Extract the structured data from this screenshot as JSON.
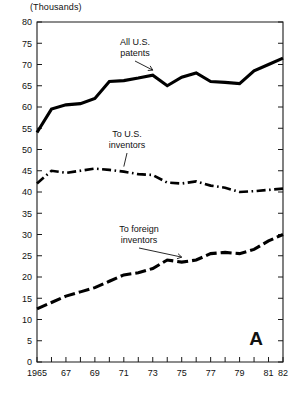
{
  "chart_data": {
    "type": "line",
    "title": "",
    "subtitle": "",
    "panel_label": "A",
    "unit_note": "(Thousands)",
    "xlabel": "",
    "ylabel": "",
    "xlim": [
      1965,
      1982
    ],
    "ylim": [
      0,
      80
    ],
    "ytick_step": 5,
    "grid": false,
    "legend_position": "inline-annotations",
    "x": [
      1965,
      1966,
      1967,
      1968,
      1969,
      1970,
      1971,
      1972,
      1973,
      1974,
      1975,
      1976,
      1977,
      1978,
      1979,
      1980,
      1981,
      1982
    ],
    "xtick_labels": [
      "1965",
      "",
      "67",
      "",
      "69",
      "",
      "71",
      "",
      "73",
      "",
      "75",
      "",
      "77",
      "",
      "79",
      "",
      "81",
      "82"
    ],
    "ytick_labels": [
      "0",
      "5",
      "10",
      "15",
      "20",
      "25",
      "30",
      "35",
      "40",
      "45",
      "50",
      "55",
      "60",
      "65",
      "70",
      "75",
      "80"
    ],
    "series": [
      {
        "name": "All U.S. patents",
        "style": "solid",
        "values": [
          54.0,
          59.5,
          60.5,
          60.8,
          62.0,
          66.0,
          66.2,
          66.8,
          67.5,
          65.0,
          67.0,
          68.0,
          66.0,
          65.8,
          65.5,
          68.5,
          70.0,
          71.5
        ]
      },
      {
        "name": "To U.S. inventors",
        "style": "dash-dot",
        "values": [
          42.0,
          45.0,
          44.5,
          45.0,
          45.5,
          45.2,
          44.8,
          44.2,
          44.0,
          42.2,
          42.0,
          42.5,
          41.5,
          41.0,
          40.0,
          40.2,
          40.5,
          40.8
        ]
      },
      {
        "name": "To foreign inventors",
        "style": "dashed",
        "values": [
          12.5,
          14.0,
          15.5,
          16.5,
          17.5,
          19.0,
          20.5,
          21.0,
          22.0,
          24.0,
          23.5,
          24.0,
          25.5,
          25.8,
          25.5,
          26.5,
          28.5,
          30.0
        ]
      }
    ],
    "annotations": [
      {
        "id": "ann-total",
        "text_line1": "All U.S.",
        "text_line2": "patents",
        "points_to_year": 1973
      },
      {
        "id": "ann-us",
        "text_line1": "To U.S.",
        "text_line2": "inventors",
        "points_to_year": 1971
      },
      {
        "id": "ann-foreign",
        "text_line1": "To foreign",
        "text_line2": "inventors",
        "points_to_year": 1975
      }
    ],
    "colors": {
      "line": "#000000",
      "axis": "#1a1a1a",
      "background": "#ffffff",
      "text": "#111111"
    }
  }
}
